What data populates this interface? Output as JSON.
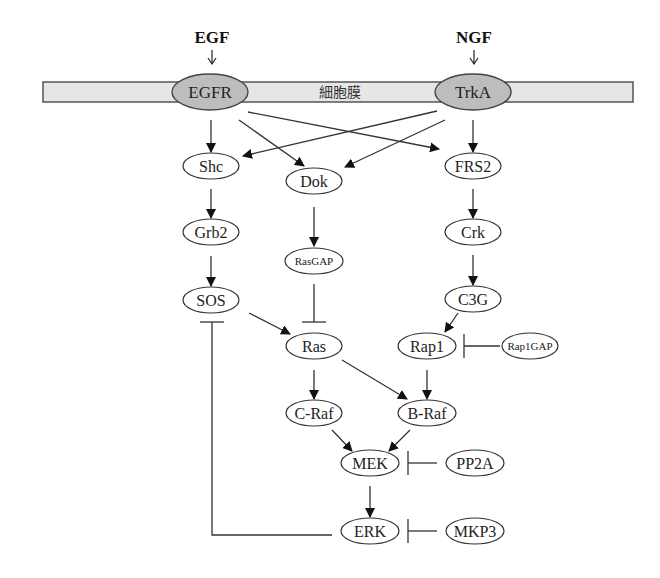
{
  "diagram": {
    "title_ligands": [
      {
        "id": "EGF",
        "label": "EGF",
        "x": 212,
        "y": 43,
        "arrow_x": 212,
        "arrow_y": 64
      },
      {
        "id": "NGF",
        "label": "NGF",
        "x": 474,
        "y": 43,
        "arrow_x": 474,
        "arrow_y": 64
      }
    ],
    "membrane": {
      "label": "細胞膜",
      "x": 43,
      "y": 82,
      "width": 590,
      "height": 20,
      "fill": "#e6e6e6",
      "stroke": "#555555",
      "label_x": 340,
      "label_y": 97
    },
    "nodes": [
      {
        "id": "EGFR",
        "label": "EGFR",
        "cx": 210,
        "cy": 92,
        "rx": 38,
        "ry": 18,
        "kind": "receptor"
      },
      {
        "id": "TrkA",
        "label": "TrkA",
        "cx": 473,
        "cy": 92,
        "rx": 38,
        "ry": 18,
        "kind": "receptor"
      },
      {
        "id": "Shc",
        "label": "Shc",
        "cx": 211,
        "cy": 166,
        "rx": 28,
        "ry": 13,
        "kind": "normal"
      },
      {
        "id": "Dok",
        "label": "Dok",
        "cx": 314,
        "cy": 181,
        "rx": 28,
        "ry": 13,
        "kind": "normal"
      },
      {
        "id": "FRS2",
        "label": "FRS2",
        "cx": 473,
        "cy": 166,
        "rx": 28,
        "ry": 13,
        "kind": "normal"
      },
      {
        "id": "Grb2",
        "label": "Grb2",
        "cx": 211,
        "cy": 232,
        "rx": 28,
        "ry": 13,
        "kind": "normal"
      },
      {
        "id": "RasGAP",
        "label": "RasGAP",
        "cx": 314,
        "cy": 261,
        "rx": 29,
        "ry": 13,
        "kind": "small"
      },
      {
        "id": "Crk",
        "label": "Crk",
        "cx": 473,
        "cy": 232,
        "rx": 28,
        "ry": 13,
        "kind": "normal"
      },
      {
        "id": "SOS",
        "label": "SOS",
        "cx": 211,
        "cy": 300,
        "rx": 28,
        "ry": 13,
        "kind": "normal"
      },
      {
        "id": "C3G",
        "label": "C3G",
        "cx": 473,
        "cy": 299,
        "rx": 28,
        "ry": 13,
        "kind": "normal"
      },
      {
        "id": "Ras",
        "label": "Ras",
        "cx": 314,
        "cy": 346,
        "rx": 28,
        "ry": 13,
        "kind": "normal"
      },
      {
        "id": "Rap1",
        "label": "Rap1",
        "cx": 427,
        "cy": 346,
        "rx": 29,
        "ry": 13,
        "kind": "normal"
      },
      {
        "id": "Rap1GAP",
        "label": "Rap1GAP",
        "cx": 530,
        "cy": 346,
        "rx": 28,
        "ry": 13,
        "kind": "small"
      },
      {
        "id": "C-Raf",
        "label": "C-Raf",
        "cx": 314,
        "cy": 413,
        "rx": 28,
        "ry": 13,
        "kind": "normal"
      },
      {
        "id": "B-Raf",
        "label": "B-Raf",
        "cx": 427,
        "cy": 413,
        "rx": 29,
        "ry": 13,
        "kind": "normal"
      },
      {
        "id": "MEK",
        "label": "MEK",
        "cx": 370,
        "cy": 463,
        "rx": 29,
        "ry": 13,
        "kind": "normal"
      },
      {
        "id": "PP2A",
        "label": "PP2A",
        "cx": 475,
        "cy": 463,
        "rx": 29,
        "ry": 13,
        "kind": "normal"
      },
      {
        "id": "ERK",
        "label": "ERK",
        "cx": 370,
        "cy": 531,
        "rx": 29,
        "ry": 13,
        "kind": "normal"
      },
      {
        "id": "MKP3",
        "label": "MKP3",
        "cx": 475,
        "cy": 531,
        "rx": 29,
        "ry": 13,
        "kind": "normal"
      }
    ],
    "edges": [
      {
        "from": "EGFR",
        "to": "Shc",
        "type": "activate",
        "points": [
          [
            211,
            120
          ],
          [
            211,
            152
          ]
        ]
      },
      {
        "from": "EGFR",
        "to": "Dok",
        "type": "activate",
        "points": [
          [
            239,
            120
          ],
          [
            304,
            166
          ]
        ]
      },
      {
        "from": "EGFR",
        "to": "FRS2",
        "type": "activate",
        "points": [
          [
            248,
            112
          ],
          [
            439,
            149
          ]
        ]
      },
      {
        "from": "TrkA",
        "to": "FRS2",
        "type": "activate",
        "points": [
          [
            473,
            120
          ],
          [
            473,
            152
          ]
        ]
      },
      {
        "from": "TrkA",
        "to": "Dok",
        "type": "activate",
        "points": [
          [
            445,
            120
          ],
          [
            345,
            167
          ]
        ]
      },
      {
        "from": "TrkA",
        "to": "Shc",
        "type": "activate",
        "points": [
          [
            437,
            111
          ],
          [
            243,
            156
          ]
        ]
      },
      {
        "from": "Shc",
        "to": "Grb2",
        "type": "activate",
        "points": [
          [
            211,
            189
          ],
          [
            211,
            218
          ]
        ]
      },
      {
        "from": "Grb2",
        "to": "SOS",
        "type": "activate",
        "points": [
          [
            211,
            256
          ],
          [
            211,
            286
          ]
        ]
      },
      {
        "from": "Dok",
        "to": "RasGAP",
        "type": "activate",
        "points": [
          [
            314,
            207
          ],
          [
            314,
            246
          ]
        ]
      },
      {
        "from": "FRS2",
        "to": "Crk",
        "type": "activate",
        "points": [
          [
            473,
            189
          ],
          [
            473,
            218
          ]
        ]
      },
      {
        "from": "Crk",
        "to": "C3G",
        "type": "activate",
        "points": [
          [
            473,
            255
          ],
          [
            473,
            285
          ]
        ]
      },
      {
        "from": "C3G",
        "to": "Rap1",
        "type": "activate",
        "points": [
          [
            458,
            313
          ],
          [
            445,
            332
          ]
        ]
      },
      {
        "from": "SOS",
        "to": "Ras",
        "type": "activate",
        "points": [
          [
            249,
            313
          ],
          [
            290,
            334
          ]
        ]
      },
      {
        "from": "RasGAP",
        "to": "Ras",
        "type": "inhibit",
        "points": [
          [
            314,
            284
          ],
          [
            314,
            322
          ]
        ]
      },
      {
        "from": "Rap1GAP",
        "to": "Rap1",
        "type": "inhibit",
        "points": [
          [
            500,
            346
          ],
          [
            464,
            346
          ]
        ]
      },
      {
        "from": "Ras",
        "to": "C-Raf",
        "type": "activate",
        "points": [
          [
            314,
            370
          ],
          [
            314,
            399
          ]
        ]
      },
      {
        "from": "Ras",
        "to": "B-Raf",
        "type": "activate",
        "points": [
          [
            342,
            360
          ],
          [
            407,
            399
          ]
        ]
      },
      {
        "from": "Rap1",
        "to": "B-Raf",
        "type": "activate",
        "points": [
          [
            427,
            370
          ],
          [
            427,
            399
          ]
        ]
      },
      {
        "from": "C-Raf",
        "to": "MEK",
        "type": "activate",
        "points": [
          [
            332,
            430
          ],
          [
            352,
            451
          ]
        ]
      },
      {
        "from": "B-Raf",
        "to": "MEK",
        "type": "activate",
        "points": [
          [
            410,
            430
          ],
          [
            389,
            451
          ]
        ]
      },
      {
        "from": "MEK",
        "to": "ERK",
        "type": "activate",
        "points": [
          [
            370,
            486
          ],
          [
            370,
            517
          ]
        ]
      },
      {
        "from": "PP2A",
        "to": "MEK",
        "type": "inhibit",
        "points": [
          [
            437,
            463
          ],
          [
            408,
            463
          ]
        ]
      },
      {
        "from": "MKP3",
        "to": "ERK",
        "type": "inhibit",
        "points": [
          [
            437,
            531
          ],
          [
            408,
            531
          ]
        ]
      },
      {
        "from": "ERK",
        "to": "SOS",
        "type": "inhibit",
        "points": [
          [
            332,
            535
          ],
          [
            212,
            535
          ],
          [
            212,
            322
          ]
        ]
      }
    ],
    "colors": {
      "line": "#333333",
      "receptor_fill": "#bdbdbd",
      "node_fill": "#ffffff",
      "background": "#ffffff"
    }
  }
}
